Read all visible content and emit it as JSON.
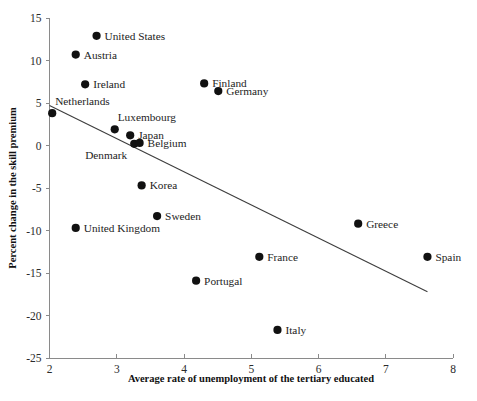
{
  "chart_data": {
    "type": "scatter",
    "title": "",
    "xlabel": "Average rate of unemployment of the tertiary educated",
    "ylabel": "Percent change in the skill premium",
    "xlim": [
      2,
      8
    ],
    "ylim": [
      -25,
      15
    ],
    "xticks": [
      "2",
      "3",
      "4",
      "5",
      "6",
      "7",
      "8"
    ],
    "xtick_values": [
      2,
      3,
      4,
      5,
      6,
      7,
      8
    ],
    "yticks": [
      "15",
      "10",
      "5",
      "0",
      "-5",
      "-10",
      "-15",
      "-20",
      "-25"
    ],
    "ytick_values": [
      15,
      10,
      5,
      0,
      -5,
      -10,
      -15,
      -20,
      -25
    ],
    "grid": false,
    "legend": "none",
    "point_color": "#111111",
    "trendline_color": "#3d3d3d",
    "points": [
      {
        "label": "United States",
        "x": 2.7,
        "y": 12.9,
        "label_side": "right"
      },
      {
        "label": "Austria",
        "x": 2.39,
        "y": 10.7,
        "label_side": "right"
      },
      {
        "label": "Ireland",
        "x": 2.53,
        "y": 7.2,
        "label_side": "right"
      },
      {
        "label": "Netherlands",
        "x": 2.04,
        "y": 3.8,
        "label_side": "above-right"
      },
      {
        "label": "Finland",
        "x": 4.3,
        "y": 7.3,
        "label_side": "right"
      },
      {
        "label": "Germany",
        "x": 4.51,
        "y": 6.4,
        "label_side": "right"
      },
      {
        "label": "Luxembourg",
        "x": 2.97,
        "y": 1.9,
        "label_side": "above-right"
      },
      {
        "label": "Japan",
        "x": 3.2,
        "y": 1.2,
        "label_side": "right"
      },
      {
        "label": "Denmark",
        "x": 3.26,
        "y": 0.2,
        "label_side": "below-left"
      },
      {
        "label": "Belgium",
        "x": 3.34,
        "y": 0.3,
        "label_side": "right"
      },
      {
        "label": "Korea",
        "x": 3.37,
        "y": -4.7,
        "label_side": "right"
      },
      {
        "label": "Sweden",
        "x": 3.6,
        "y": -8.3,
        "label_side": "right"
      },
      {
        "label": "United Kingdom",
        "x": 2.39,
        "y": -9.7,
        "label_side": "right"
      },
      {
        "label": "Portugal",
        "x": 4.18,
        "y": -15.9,
        "label_side": "right"
      },
      {
        "label": "France",
        "x": 5.12,
        "y": -13.1,
        "label_side": "right"
      },
      {
        "label": "Greece",
        "x": 6.59,
        "y": -9.2,
        "label_side": "right"
      },
      {
        "label": "Spain",
        "x": 7.62,
        "y": -13.1,
        "label_side": "right"
      },
      {
        "label": "Italy",
        "x": 5.39,
        "y": -21.7,
        "label_side": "right"
      }
    ],
    "trendline": {
      "x_start": 2.0,
      "y_start": 4.7,
      "x_end": 7.62,
      "y_end": -17.2
    }
  }
}
